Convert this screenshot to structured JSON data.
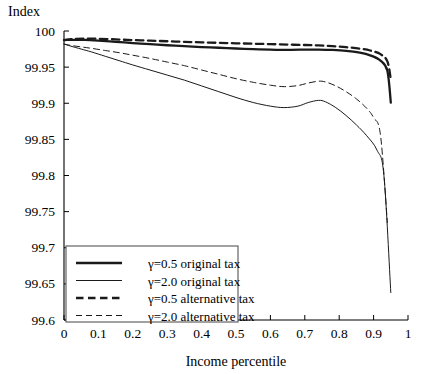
{
  "chart_data": {
    "type": "line",
    "title": "",
    "ylabel": "Index",
    "xlabel": "Income percentile",
    "xlim": [
      0,
      1
    ],
    "ylim": [
      99.6,
      100
    ],
    "grid": false,
    "xticks": [
      0,
      0.1,
      0.2,
      0.3,
      0.4,
      0.5,
      0.6,
      0.7,
      0.8,
      0.9,
      1
    ],
    "xticklabels": [
      "0",
      "0.1",
      "0.2",
      "0.3",
      "0.4",
      "0.5",
      "0.6",
      "0.7",
      "0.8",
      "0.9",
      "1"
    ],
    "yticks": [
      99.6,
      99.65,
      99.7,
      99.75,
      99.8,
      99.85,
      99.9,
      99.95,
      100
    ],
    "yticklabels": [
      "99.6",
      "99.65",
      "99.7",
      "99.75",
      "99.8",
      "99.85",
      "99.9",
      "99.95",
      "100"
    ],
    "legend_position": "lower left",
    "series": [
      {
        "name": "γ=0.5 original tax",
        "style": "solid",
        "width": "thick",
        "x": [
          0,
          0.03,
          0.06,
          0.1,
          0.15,
          0.2,
          0.25,
          0.3,
          0.35,
          0.4,
          0.45,
          0.5,
          0.55,
          0.6,
          0.63,
          0.66,
          0.7,
          0.74,
          0.78,
          0.82,
          0.86,
          0.89,
          0.92,
          0.94,
          0.95
        ],
        "y": [
          99.9875,
          99.9878,
          99.9876,
          99.9866,
          99.985,
          99.9833,
          99.9817,
          99.9803,
          99.979,
          99.9778,
          99.9768,
          99.9758,
          99.9749,
          99.9741,
          99.9738,
          99.9739,
          99.9742,
          99.9743,
          99.9738,
          99.9726,
          99.97,
          99.9663,
          99.959,
          99.945,
          99.901
        ]
      },
      {
        "name": "γ=2.0 original tax",
        "style": "solid",
        "width": "thin",
        "x": [
          0,
          0.02,
          0.05,
          0.08,
          0.12,
          0.16,
          0.2,
          0.25,
          0.3,
          0.35,
          0.4,
          0.45,
          0.5,
          0.55,
          0.6,
          0.64,
          0.68,
          0.71,
          0.74,
          0.76,
          0.79,
          0.82,
          0.85,
          0.88,
          0.91,
          0.93,
          0.95
        ],
        "y": [
          99.982,
          99.979,
          99.975,
          99.971,
          99.965,
          99.959,
          99.953,
          99.946,
          99.939,
          99.932,
          99.924,
          99.916,
          99.908,
          99.901,
          99.896,
          99.894,
          99.896,
          99.901,
          99.904,
          99.902,
          99.894,
          99.883,
          99.87,
          99.855,
          99.835,
          99.8,
          99.638
        ]
      },
      {
        "name": "γ=0.5 alternative tax",
        "style": "dashed",
        "width": "thick",
        "x": [
          0,
          0.03,
          0.06,
          0.1,
          0.15,
          0.2,
          0.25,
          0.3,
          0.35,
          0.4,
          0.45,
          0.5,
          0.55,
          0.6,
          0.65,
          0.7,
          0.74,
          0.78,
          0.82,
          0.86,
          0.89,
          0.92,
          0.94,
          0.95
        ],
        "y": [
          99.9875,
          99.989,
          99.9895,
          99.9892,
          99.9884,
          99.9874,
          99.9866,
          99.9858,
          99.985,
          99.9843,
          99.9836,
          99.983,
          99.9824,
          99.9818,
          99.9812,
          99.9806,
          99.98,
          99.979,
          99.9776,
          99.9756,
          99.973,
          99.968,
          99.958,
          99.933
        ]
      },
      {
        "name": "γ=2.0 alternative tax",
        "style": "dashed",
        "width": "thin",
        "x": [
          0,
          0.02,
          0.05,
          0.08,
          0.12,
          0.16,
          0.2,
          0.25,
          0.3,
          0.35,
          0.4,
          0.45,
          0.5,
          0.55,
          0.6,
          0.64,
          0.68,
          0.71,
          0.74,
          0.76,
          0.79,
          0.82,
          0.85,
          0.88,
          0.9,
          0.92,
          0.94
        ],
        "y": [
          99.982,
          99.98,
          99.978,
          99.976,
          99.973,
          99.97,
          99.9665,
          99.962,
          99.957,
          99.952,
          99.946,
          99.94,
          99.934,
          99.929,
          99.925,
          99.923,
          99.9245,
          99.928,
          99.9305,
          99.9295,
          99.924,
          99.916,
          99.906,
          99.893,
          99.88,
          99.856,
          99.735
        ]
      }
    ]
  },
  "legend": {
    "entries": [
      {
        "label": "γ=0.5 original tax",
        "style": "solid",
        "width": "thick"
      },
      {
        "label": "γ=2.0 original tax",
        "style": "solid",
        "width": "thin"
      },
      {
        "label": "γ=0.5 alternative tax",
        "style": "dashed",
        "width": "thick"
      },
      {
        "label": "γ=2.0 alternative tax",
        "style": "dashed",
        "width": "thin"
      }
    ]
  },
  "colors": {
    "curve": "#1a1a1a",
    "axis": "#000000",
    "background": "#ffffff"
  }
}
